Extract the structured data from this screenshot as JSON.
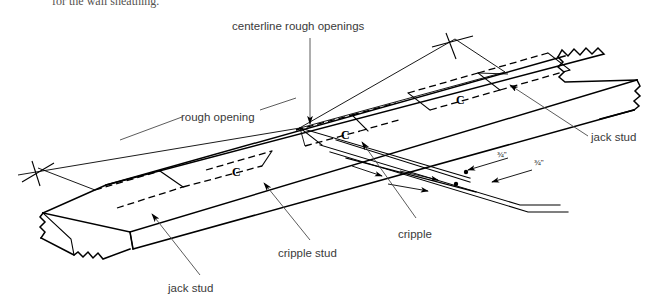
{
  "document": {
    "caption_fragment": "for the wall sheathing.",
    "diagram_type": "isometric-construction-detail",
    "subject": "wall plate layout marking"
  },
  "labels": {
    "centerline_rough_openings": "centerline rough openings",
    "rough_opening": "rough opening",
    "jack_stud_right": "jack stud",
    "jack_stud_left": "jack stud",
    "cripple_stud": "cripple stud",
    "cripple": "cripple"
  },
  "dimensions": [
    {
      "id": "dim-1",
      "value": "¾\""
    },
    {
      "id": "dim-2",
      "value": "¾\""
    }
  ],
  "marks": [
    {
      "id": "mark-c-right",
      "value": "C"
    },
    {
      "id": "mark-c-left",
      "value": "C"
    },
    {
      "id": "mark-c-center",
      "value": "C"
    }
  ],
  "colors": {
    "line": "#000000",
    "label_text": "#3a3a3a",
    "leader": "#4a4a4a",
    "caption_text": "#55524f",
    "background": "#ffffff"
  }
}
